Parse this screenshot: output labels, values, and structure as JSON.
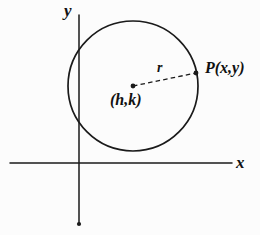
{
  "figure": {
    "background_color": "#fcfcfc",
    "ink_color": "#111111"
  },
  "axes": {
    "x_axis": {
      "label": "x",
      "name": "x-axis",
      "from": [
        10,
        163
      ],
      "to": [
        232,
        163
      ]
    },
    "y_axis": {
      "label": "y",
      "name": "y-axis",
      "from": [
        79,
        15
      ],
      "to": [
        79,
        224
      ]
    },
    "origin": [
      79,
      163
    ]
  },
  "circle": {
    "center_px": [
      133,
      86
    ],
    "radius_px": 65,
    "center_label": "(h,k)",
    "stroke": "#111111"
  },
  "radius": {
    "label": "r",
    "style": "dashed",
    "from": [
      133,
      86
    ],
    "to": [
      196,
      73
    ]
  },
  "point": {
    "label": "P(x,y)",
    "position_px": [
      196,
      73
    ]
  },
  "markers": {
    "center_dot": "center-point-dot",
    "point_dot": "p-point-dot",
    "y_axis_end_dot": "y-axis-terminal-dot"
  }
}
